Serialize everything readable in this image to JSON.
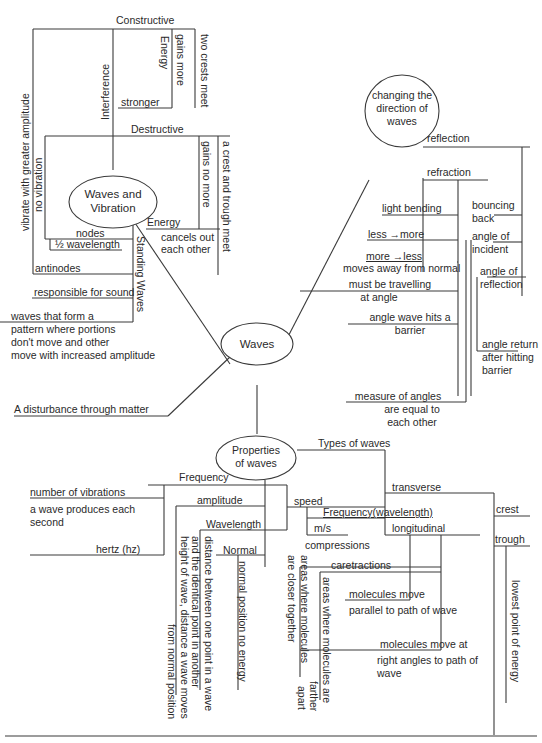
{
  "nodes": {
    "waves": "Waves",
    "waves_vibration": [
      "Waves and",
      "Vibration"
    ],
    "changing_direction": [
      "changing the",
      "direction of",
      "waves"
    ],
    "properties": [
      "Properties",
      "of waves"
    ]
  },
  "vibration_branch": {
    "constructive": "Constructive",
    "two_crests_meet": "two crests meet",
    "gains_more": "gains more",
    "energy_1": "Energy",
    "stronger": "stronger",
    "interference": "Interference",
    "destructive": "Destructive",
    "gains_no_more": "gains no more",
    "crest_trough_meet": "a crest and trough meet",
    "energy_2": "Energy",
    "cancels_out": [
      "cancels out",
      "each other"
    ],
    "vibrate_greater": "vibrate with greater amplitude",
    "no_vibration": "no vibration",
    "nodes": "nodes",
    "half_wavelength": "½  wavelength",
    "antinodes": "antinodes",
    "standing_waves": "Standing Waves",
    "responsible_sound": "responsible for sound",
    "standing_def": [
      "waves that form a",
      "pattern where portions",
      "don't move and other",
      "move with increased amplitude"
    ]
  },
  "direction_branch": {
    "reflection": "reflection",
    "refraction": "refraction",
    "light_bending": "light bending",
    "less_more": "less →more",
    "more_less": "more →less",
    "moves_away": "moves away from normal",
    "must_travel": [
      "must be travelling",
      "at angle"
    ],
    "angle_wave_hits": [
      "angle wave hits a",
      "barrier"
    ],
    "measure_angles": [
      "measure of angles",
      "are equal to",
      "each other"
    ],
    "bouncing_back": [
      "bouncing",
      "back"
    ],
    "angle_incident": [
      "angle of",
      "incident"
    ],
    "angle_reflection": [
      "angle of",
      "reflection"
    ],
    "angle_return": [
      "angle return",
      "after hitting",
      "barrier"
    ]
  },
  "disturbance": "A disturbance through matter",
  "properties_branch": {
    "frequency": "Frequency",
    "number_vibrations": "number of vibrations",
    "wave_produces": [
      "a wave produces each",
      "second"
    ],
    "hertz": "hertz (hz)",
    "amplitude": "amplitude",
    "wavelength": "Wavelength",
    "normal": "Normal",
    "normal_position": "normal position no energy",
    "wavelength_def": [
      "distance between one point in a wave",
      "and the identical point  in another"
    ],
    "amplitude_def": [
      "height of wave, distance a wave moves",
      "from normal position"
    ],
    "speed": "speed",
    "freq_wavelength": "Frequency(wavelength)",
    "ms": "m/s",
    "types_of_waves": "Types of waves",
    "transverse": "transverse",
    "crest": "crest",
    "trough": "trough",
    "lowest_point": "lowest point of energy",
    "longitudinal": "longitudinal",
    "compressions": "compressions",
    "compressions_def": [
      "areas where molecules",
      "are closer together"
    ],
    "caretractions": "caretractions",
    "rarefaction_def": [
      "areas where molecules are",
      "farther",
      "apart"
    ],
    "molecules_parallel": [
      "molecules move",
      "parallel to path of wave"
    ],
    "molecules_right": [
      "molecules move at",
      "right angles to path of",
      "wave"
    ]
  }
}
